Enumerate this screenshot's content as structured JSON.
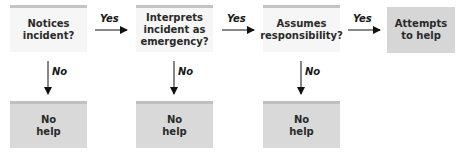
{
  "diagram": {
    "type": "flowchart",
    "steps": [
      {
        "label": "Notices incident?",
        "line1": "Notices",
        "line2": "incident?",
        "line3": ""
      },
      {
        "label": "Interprets incident as emergency?",
        "line1": "Interprets",
        "line2": "incident as",
        "line3": "emergency?"
      },
      {
        "label": "Assumes responsibility?",
        "line1": "Assumes",
        "line2": "responsibility?",
        "line3": ""
      }
    ],
    "final": {
      "label": "Attempts to help",
      "line1": "Attempts",
      "line2": "to help"
    },
    "no_outcome": {
      "line1": "No",
      "line2": "help"
    },
    "yes_label": "Yes",
    "no_label": "No",
    "colors": {
      "decision_fill": "#f6f6f6",
      "outcome_fill": "#d9d9d9",
      "arrow": "#111111"
    }
  }
}
